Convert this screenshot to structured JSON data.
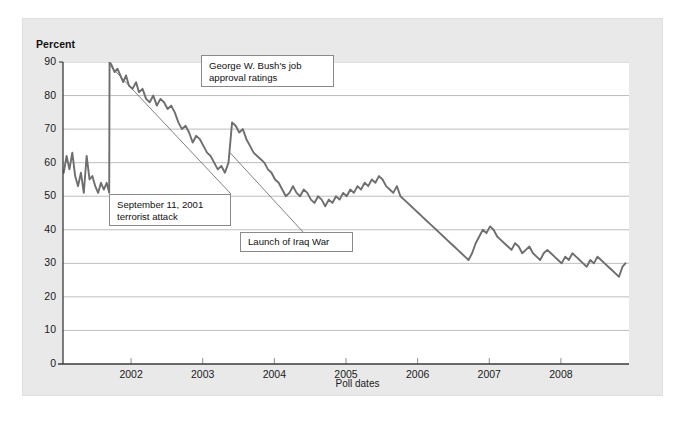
{
  "figure": {
    "caption": "FIGURE :: 5"
  },
  "axes": {
    "y_title": "Percent",
    "x_title": "Poll dates",
    "y_ticks": [
      "0",
      "10",
      "20",
      "30",
      "40",
      "50",
      "60",
      "70",
      "80",
      "90"
    ],
    "x_ticks": [
      "2002",
      "2003",
      "2004",
      "2005",
      "2006",
      "2007",
      "2008"
    ]
  },
  "annotations": [
    {
      "id": "bush",
      "text": "George W. Bush's job\napproval ratings"
    },
    {
      "id": "sept",
      "text": "September 11, 2001\nterrorist attack"
    },
    {
      "id": "iraq",
      "text": "Launch of Iraq War"
    }
  ],
  "colors": {
    "panel_background": "#e9e9e9",
    "plot_background": "#ffffff",
    "series_line": "#6e6e6e",
    "gridline": "#bdbdbd",
    "axis": "#3a3a3a",
    "callout_border": "#8a8a8a",
    "text": "#1a1a1a"
  },
  "chart_data": {
    "type": "line",
    "title": "George W. Bush's job approval ratings",
    "xlabel": "Poll dates",
    "ylabel": "Percent",
    "ylim": [
      0,
      90
    ],
    "xlim": [
      2001.05,
      2008.95
    ],
    "grid": true,
    "legend": "none",
    "y_ticks": [
      0,
      10,
      20,
      30,
      40,
      50,
      60,
      70,
      80,
      90
    ],
    "x_ticks": [
      2002,
      2003,
      2004,
      2005,
      2006,
      2007,
      2008
    ],
    "events": [
      {
        "label": "September 11, 2001 terrorist attack",
        "x": 2001.7,
        "y": 90
      },
      {
        "label": "Launch of Iraq War",
        "x": 2003.22,
        "y": 72
      }
    ],
    "series": [
      {
        "name": "Job approval (%)",
        "x": [
          2001.06,
          2001.1,
          2001.14,
          2001.18,
          2001.22,
          2001.26,
          2001.3,
          2001.34,
          2001.38,
          2001.42,
          2001.46,
          2001.5,
          2001.54,
          2001.58,
          2001.62,
          2001.66,
          2001.695,
          2001.7,
          2001.73,
          2001.77,
          2001.81,
          2001.85,
          2001.89,
          2001.93,
          2001.97,
          2002.02,
          2002.07,
          2002.11,
          2002.16,
          2002.21,
          2002.26,
          2002.31,
          2002.36,
          2002.41,
          2002.46,
          2002.51,
          2002.56,
          2002.61,
          2002.66,
          2002.71,
          2002.76,
          2002.81,
          2002.86,
          2002.91,
          2002.96,
          2003.01,
          2003.06,
          2003.11,
          2003.16,
          2003.21,
          2003.26,
          2003.31,
          2003.36,
          2003.41,
          2003.46,
          2003.51,
          2003.56,
          2003.61,
          2003.66,
          2003.71,
          2003.76,
          2003.81,
          2003.86,
          2003.91,
          2003.96,
          2004.01,
          2004.06,
          2004.11,
          2004.16,
          2004.21,
          2004.26,
          2004.31,
          2004.36,
          2004.41,
          2004.46,
          2004.51,
          2004.56,
          2004.61,
          2004.66,
          2004.71,
          2004.76,
          2004.81,
          2004.86,
          2004.91,
          2004.96,
          2005.01,
          2005.06,
          2005.11,
          2005.16,
          2005.21,
          2005.26,
          2005.31,
          2005.36,
          2005.41,
          2005.46,
          2005.51,
          2005.56,
          2005.61,
          2005.66,
          2005.71,
          2005.76,
          2005.81,
          2005.86,
          2005.91,
          2005.96,
          2006.01,
          2006.06,
          2006.11,
          2006.16,
          2006.21,
          2006.26,
          2006.31,
          2006.36,
          2006.41,
          2006.46,
          2006.51,
          2006.56,
          2006.61,
          2006.66,
          2006.71,
          2006.76,
          2006.81,
          2006.86,
          2006.91,
          2006.96,
          2007.01,
          2007.06,
          2007.11,
          2007.16,
          2007.21,
          2007.26,
          2007.31,
          2007.36,
          2007.41,
          2007.46,
          2007.51,
          2007.56,
          2007.61,
          2007.66,
          2007.71,
          2007.76,
          2007.81,
          2007.86,
          2007.91,
          2007.96,
          2008.01,
          2008.06,
          2008.11,
          2008.16,
          2008.21,
          2008.26,
          2008.31,
          2008.36,
          2008.41,
          2008.46,
          2008.51,
          2008.56,
          2008.61,
          2008.66,
          2008.71,
          2008.76,
          2008.81,
          2008.86,
          2008.9
        ],
        "values": [
          57,
          62,
          58,
          63,
          56,
          53,
          57,
          51,
          62,
          55,
          56,
          53,
          51,
          54,
          52,
          54,
          51,
          90,
          89,
          87,
          88,
          86,
          84,
          86,
          83,
          82,
          84,
          81,
          82,
          79,
          78,
          80,
          77,
          79,
          78,
          76,
          77,
          75,
          72,
          70,
          71,
          69,
          66,
          68,
          67,
          65,
          63,
          62,
          60,
          58,
          59,
          57,
          60,
          72,
          71,
          69,
          70,
          67,
          65,
          63,
          62,
          61,
          60,
          58,
          57,
          55,
          54,
          52,
          50,
          51,
          53,
          51,
          50,
          52,
          51,
          49,
          48,
          50,
          49,
          47,
          49,
          48,
          50,
          49,
          51,
          50,
          52,
          51,
          53,
          52,
          54,
          53,
          55,
          54,
          56,
          55,
          53,
          52,
          51,
          53,
          50,
          49,
          48,
          47,
          46,
          45,
          44,
          43,
          42,
          41,
          40,
          39,
          38,
          37,
          36,
          35,
          34,
          33,
          32,
          31,
          33,
          36,
          38,
          40,
          39,
          41,
          40,
          38,
          37,
          36,
          35,
          34,
          36,
          35,
          33,
          34,
          35,
          33,
          32,
          31,
          33,
          34,
          33,
          32,
          31,
          30,
          32,
          31,
          33,
          32,
          31,
          30,
          29,
          31,
          30,
          32,
          31,
          30,
          29,
          28,
          27,
          26,
          29,
          30
        ]
      }
    ]
  }
}
